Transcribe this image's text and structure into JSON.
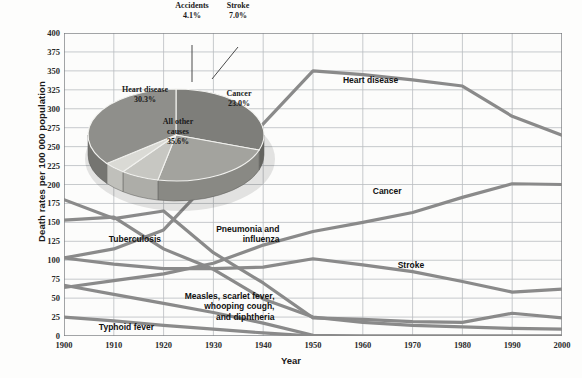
{
  "chart_data": {
    "type": "line",
    "title": "",
    "xlabel": "Year",
    "ylabel": "Death rates per 100 000 population",
    "xlim": [
      1900,
      2000
    ],
    "ylim": [
      0,
      400
    ],
    "yticks": [
      0,
      25,
      50,
      75,
      100,
      125,
      150,
      175,
      200,
      225,
      250,
      275,
      300,
      325,
      350,
      375,
      400
    ],
    "xticks": [
      1900,
      1910,
      1920,
      1930,
      1940,
      1950,
      1960,
      1970,
      1980,
      1990,
      2000
    ],
    "grid": true,
    "legend_position": "inline-annotations",
    "series": [
      {
        "name": "Heart disease",
        "x": [
          1900,
          1910,
          1920,
          1930,
          1940,
          1950,
          1960,
          1970,
          1980,
          1990,
          2000
        ],
        "values": [
          103,
          115,
          140,
          210,
          280,
          350,
          345,
          338,
          330,
          290,
          265
        ]
      },
      {
        "name": "Cancer",
        "x": [
          1900,
          1910,
          1920,
          1930,
          1940,
          1950,
          1960,
          1970,
          1980,
          1990,
          2000
        ],
        "values": [
          64,
          73,
          82,
          96,
          120,
          138,
          150,
          163,
          183,
          201,
          200
        ]
      },
      {
        "name": "Stroke",
        "x": [
          1900,
          1910,
          1920,
          1930,
          1940,
          1950,
          1960,
          1970,
          1980,
          1990,
          2000
        ],
        "values": [
          103,
          95,
          89,
          89,
          91,
          102,
          94,
          85,
          72,
          58,
          62
        ]
      },
      {
        "name": "Pneumonia and influenza",
        "x": [
          1900,
          1910,
          1920,
          1930,
          1940,
          1950,
          1960,
          1970,
          1980,
          1990,
          2000
        ],
        "values": [
          180,
          155,
          165,
          110,
          70,
          24,
          22,
          19,
          18,
          30,
          24
        ]
      },
      {
        "name": "Tuberculosis",
        "x": [
          1900,
          1910,
          1920,
          1930,
          1940,
          1950,
          1960,
          1970,
          1980,
          1990,
          2000
        ],
        "values": [
          153,
          157,
          115,
          88,
          49,
          25,
          18,
          14,
          12,
          10,
          9
        ]
      },
      {
        "name": "Measles, scarlet fever, whooping cough, and diphtheria",
        "x": [
          1900,
          1910,
          1920,
          1930,
          1940,
          1950,
          1960,
          1970,
          1980,
          1990,
          2000
        ],
        "values": [
          67,
          55,
          43,
          31,
          17,
          1,
          0,
          0,
          0,
          0,
          0
        ]
      },
      {
        "name": "Typhoid fever",
        "x": [
          1900,
          1910,
          1920,
          1930,
          1940,
          1950,
          1960,
          1970,
          1980,
          1990,
          2000
        ],
        "values": [
          25,
          20,
          14,
          9,
          4,
          0,
          0,
          0,
          0,
          0,
          0
        ]
      }
    ],
    "series_labels": [
      {
        "text": "Heart disease",
        "x": 1956,
        "y": 337
      },
      {
        "text": "Cancer",
        "x": 1962,
        "y": 190
      },
      {
        "text": "Stroke",
        "x": 1967,
        "y": 92
      },
      {
        "text": "Pneumonia and\ninfluenza",
        "x": 1926,
        "y": 140
      },
      {
        "text": "Tuberculosis",
        "x": 1909,
        "y": 127
      },
      {
        "text": "Measles, scarlet fever,\nwhooping cough,\nand diphtheria",
        "x": 1925,
        "y": 52
      },
      {
        "text": "Typhoid fever",
        "x": 1907,
        "y": 10
      }
    ],
    "inset_pie": {
      "type": "pie",
      "slices": [
        {
          "label": "Heart disease",
          "value": 30.3,
          "display": "30.3%"
        },
        {
          "label": "Cancer",
          "value": 23.0,
          "display": "23.0%"
        },
        {
          "label": "Stroke",
          "value": 7.0,
          "display": "7.0%"
        },
        {
          "label": "Accidents",
          "value": 4.1,
          "display": "4.1%"
        },
        {
          "label": "All other causes",
          "value": 35.6,
          "display": "35.6%"
        }
      ]
    },
    "colors": {
      "line": "#8a8a8a",
      "grid": "#b9bcc0",
      "axis": "#6f7276",
      "pie_top": "#b2b2ae",
      "pie_light": "#d2d2cd",
      "pie_side": "#8e8e8a",
      "background": "#fdfdfc"
    }
  }
}
